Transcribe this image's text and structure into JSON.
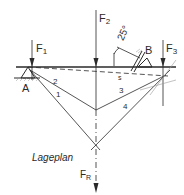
{
  "diagram": {
    "title": "Lageplan",
    "forces": [
      {
        "name": "F",
        "sub": "1"
      },
      {
        "name": "F",
        "sub": "2"
      },
      {
        "name": "F",
        "sub": "3"
      },
      {
        "name": "F",
        "sub": "R"
      }
    ],
    "supports": {
      "A": "A",
      "B": "B"
    },
    "angle": "25°",
    "rays": [
      "1",
      "2",
      "3",
      "4"
    ],
    "closing_line": "s",
    "colors": {
      "line": "#2a2a2a",
      "hatch": "#888888",
      "background": "#ffffff"
    }
  }
}
